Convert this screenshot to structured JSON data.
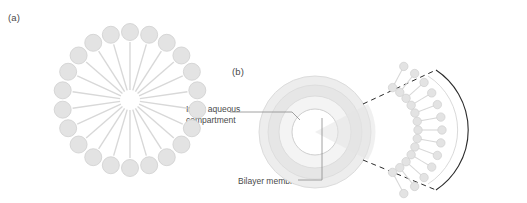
{
  "figure": {
    "panels": [
      {
        "id": "a",
        "label": "(a)",
        "description": "micelle cross-section with radial amphipathic lipids"
      },
      {
        "id": "b",
        "label": "(b)",
        "description": "liposome cross-section with magnified bilayer wedge"
      }
    ],
    "annotations": [
      {
        "id": "inner-aqueous-compartment",
        "text": "Inner aqueous\ncompartment"
      },
      {
        "id": "bilayer-membrane",
        "text": "Bilayer membrane"
      }
    ],
    "colors": {
      "lipid_head": "#e3e3e3",
      "lipid_head_stroke": "#cfcfcf",
      "lipid_tail": "#d8d8d8",
      "vesicle_fill": "#ededed",
      "vesicle_stroke": "#d5d5d5",
      "leader_line": "#8a8a8a",
      "text": "#4a4a4a"
    }
  }
}
